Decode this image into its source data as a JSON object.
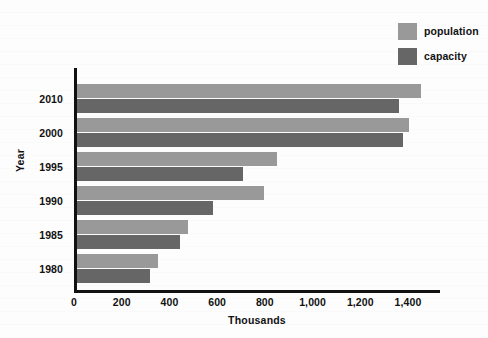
{
  "chart_data": {
    "type": "bar",
    "orientation": "horizontal",
    "title": "",
    "xlabel": "Thousands",
    "ylabel": "Year",
    "categories": [
      "2010",
      "2000",
      "1995",
      "1990",
      "1985",
      "1980"
    ],
    "series": [
      {
        "name": "population",
        "color": "#999999",
        "values": [
          1440,
          1390,
          838,
          785,
          465,
          340
        ]
      },
      {
        "name": "capacity",
        "color": "#666666",
        "values": [
          1350,
          1365,
          696,
          570,
          432,
          306
        ]
      }
    ],
    "xlim": [
      0,
      1400
    ],
    "xticks": [
      0,
      200,
      400,
      600,
      800,
      1000,
      1200,
      1400
    ],
    "xtick_labels": [
      "0",
      "200",
      "400",
      "600",
      "800",
      "1,000",
      "1,200",
      "1,400"
    ],
    "grid": false,
    "legend_position": "top-right"
  },
  "legend": {
    "items": [
      {
        "label": "population",
        "color": "#999999"
      },
      {
        "label": "capacity",
        "color": "#666666"
      }
    ]
  },
  "axes": {
    "x_title": "Thousands",
    "y_title": "Year"
  },
  "colors": {
    "population": "#999999",
    "capacity": "#666666",
    "axis": "#111111",
    "background": "#fdfdfd"
  }
}
